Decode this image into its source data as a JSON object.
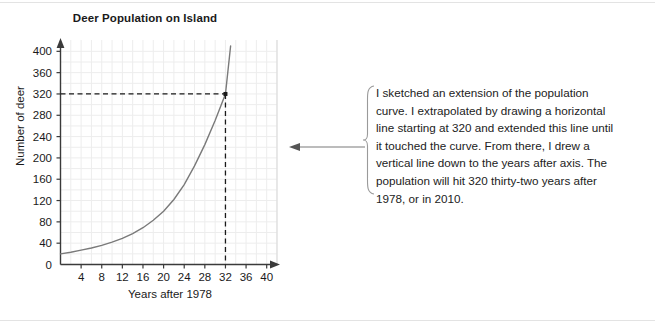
{
  "chart_data": {
    "type": "line",
    "title": "Deer Population on Island",
    "xlabel": "Years after 1978",
    "ylabel": "Number of deer",
    "xlim": [
      0,
      42
    ],
    "ylim": [
      0,
      410
    ],
    "xticks": [
      "4",
      "8",
      "12",
      "16",
      "20",
      "24",
      "28",
      "32",
      "36",
      "40"
    ],
    "xtick_values": [
      4,
      8,
      12,
      16,
      20,
      24,
      28,
      32,
      36,
      40
    ],
    "yticks": [
      "0",
      "40",
      "80",
      "120",
      "160",
      "200",
      "240",
      "280",
      "320",
      "360",
      "400"
    ],
    "ytick_values": [
      0,
      40,
      80,
      120,
      160,
      200,
      240,
      280,
      320,
      360,
      400
    ],
    "grid": true,
    "legend": "none",
    "series": [
      {
        "name": "Deer population",
        "x": [
          0,
          2,
          4,
          6,
          8,
          10,
          12,
          14,
          16,
          18,
          20,
          22,
          24,
          26,
          28,
          30,
          32,
          33
        ],
        "values": [
          20,
          23,
          27,
          31,
          36,
          42,
          49,
          58,
          69,
          83,
          100,
          122,
          150,
          185,
          225,
          270,
          320,
          410
        ]
      }
    ],
    "annotations": [
      {
        "name": "horizontal-extrapolation-line",
        "type": "dashed-horizontal",
        "y": 320,
        "x_from": 0,
        "x_to": 32
      },
      {
        "name": "vertical-extrapolation-line",
        "type": "dashed-vertical",
        "x": 32,
        "y_from": 0,
        "y_to": 320
      },
      {
        "name": "intersection-point",
        "type": "point",
        "x": 32,
        "y": 320
      }
    ]
  },
  "callout": {
    "text": "I sketched an extension of the population curve. I extrapolated by drawing a horizontal line starting at 320 and extended this line until it touched the curve. From there, I drew a vertical line down to the years after axis. The population will hit 320 thirty-two years after 1978, or in 2010."
  },
  "colors": {
    "curve": "#7a7a7a",
    "axis": "#3a3a3a",
    "grid": "#ededed",
    "dashed": "#1a1a1a",
    "text": "#1a1a1a",
    "bracket": "#9a9a9a",
    "arrow": "#7a7a7a",
    "rule": "#e3e3e3"
  }
}
